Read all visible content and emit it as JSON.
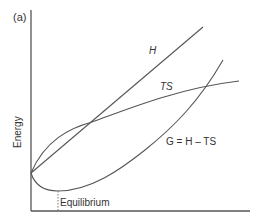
{
  "figure": {
    "panel_label": "(a)",
    "y_axis_label": "Energy",
    "x_axis_label": "",
    "annotation_equilibrium": "Equilibrium",
    "curves": {
      "H": {
        "label": "H",
        "type": "line"
      },
      "TS": {
        "label": "TS",
        "type": "concave curve"
      },
      "G": {
        "label": "G = H – TS",
        "type": "U-shaped curve"
      }
    },
    "colors": {
      "axis": "#555555",
      "curve": "#555555",
      "text": "#333333"
    }
  }
}
